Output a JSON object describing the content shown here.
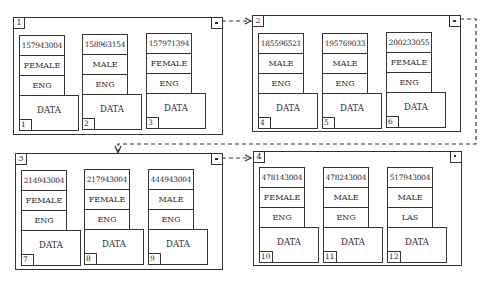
{
  "diagram": {
    "type": "linked-list-of-pages",
    "pages": [
      {
        "number": "1",
        "link_marker": "pointer",
        "records": [
          {
            "id": "157943004",
            "sex": "FEMALE",
            "lang": "ENG",
            "data": "DATA",
            "slot": "1"
          },
          {
            "id": "158963154",
            "sex": "MALE",
            "lang": "ENG",
            "data": "DATA",
            "slot": "2"
          },
          {
            "id": "157971394",
            "sex": "FEMALE",
            "lang": "ENG",
            "data": "DATA",
            "slot": "3"
          }
        ]
      },
      {
        "number": "2",
        "link_marker": "pointer",
        "records": [
          {
            "id": "185596521",
            "sex": "MALE",
            "lang": "ENG",
            "data": "DATA",
            "slot": "4"
          },
          {
            "id": "195769033",
            "sex": "MALE",
            "lang": "ENG",
            "data": "DATA",
            "slot": "5"
          },
          {
            "id": "200233055",
            "sex": "FEMALE",
            "lang": "ENG",
            "data": "DATA",
            "slot": "6"
          }
        ]
      },
      {
        "number": "3",
        "link_marker": "pointer",
        "records": [
          {
            "id": "214943004",
            "sex": "FEMALE",
            "lang": "ENG",
            "data": "DATA",
            "slot": "7"
          },
          {
            "id": "217943004",
            "sex": "FEMALE",
            "lang": "ENG",
            "data": "DATA",
            "slot": "8"
          },
          {
            "id": "444943004",
            "sex": "MALE",
            "lang": "ENG",
            "data": "DATA",
            "slot": "9"
          }
        ]
      },
      {
        "number": "4",
        "link_marker": "null",
        "records": [
          {
            "id": "478143004",
            "sex": "FEMALE",
            "lang": "ENG",
            "data": "DATA",
            "slot": "10"
          },
          {
            "id": "478243004",
            "sex": "MALE",
            "lang": "ENG",
            "data": "DATA",
            "slot": "11"
          },
          {
            "id": "517943004",
            "sex": "MALE",
            "lang": "LAS",
            "data": "DATA",
            "slot": "12"
          }
        ]
      }
    ],
    "links": [
      {
        "from": "1",
        "to": "2",
        "style": "dashed-arrow"
      },
      {
        "from": "2",
        "to": "3",
        "style": "dashed-arrow"
      },
      {
        "from": "3",
        "to": "4",
        "style": "dashed-arrow"
      }
    ]
  }
}
